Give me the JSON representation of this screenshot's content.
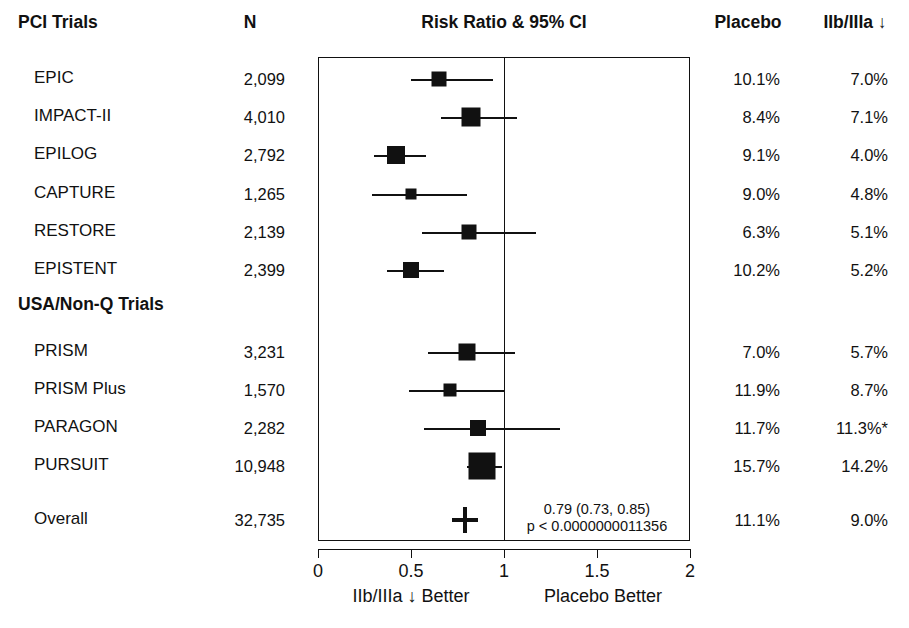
{
  "headers": {
    "trials": "PCI Trials",
    "n": "N",
    "plot_title": "Risk Ratio & 95% CI",
    "placebo": "Placebo",
    "treatment": "IIb/IIIa ↓"
  },
  "group_header_2": "USA/Non-Q Trials",
  "axis": {
    "ticks": [
      "0",
      "0.5",
      "1",
      "1.5",
      "2"
    ],
    "tick_values": [
      0,
      0.5,
      1,
      1.5,
      2
    ],
    "left_caption": "IIb/IIIa ↓ Better",
    "right_caption": "Placebo Better",
    "min": 0,
    "max": 2
  },
  "summary_annotation": {
    "estimate": "0.79 (0.73, 0.85)",
    "pvalue": "p < 0.0000000011356"
  },
  "chart_data": {
    "type": "forest",
    "title": "Risk Ratio & 95% CI",
    "xlabel": "Risk Ratio",
    "xlim": [
      0,
      2
    ],
    "null_value": 1,
    "grid": false,
    "legend": "none",
    "columns": [
      "Trial",
      "N",
      "Risk Ratio & 95% CI",
      "Placebo",
      "IIb/IIIa ↓"
    ],
    "groups": [
      {
        "name": "PCI Trials",
        "rows": [
          {
            "label": "EPIC",
            "n": "2,099",
            "rr": 0.65,
            "lo": 0.5,
            "hi": 0.94,
            "box": 15,
            "placebo": "10.1%",
            "treatment": "7.0%"
          },
          {
            "label": "IMPACT-II",
            "n": "4,010",
            "rr": 0.82,
            "lo": 0.66,
            "hi": 1.07,
            "box": 19,
            "placebo": "8.4%",
            "treatment": "7.1%"
          },
          {
            "label": "EPILOG",
            "n": "2,792",
            "rr": 0.42,
            "lo": 0.3,
            "hi": 0.58,
            "box": 18,
            "placebo": "9.1%",
            "treatment": "4.0%"
          },
          {
            "label": "CAPTURE",
            "n": "1,265",
            "rr": 0.5,
            "lo": 0.29,
            "hi": 0.8,
            "box": 11,
            "placebo": "9.0%",
            "treatment": "4.8%"
          },
          {
            "label": "RESTORE",
            "n": "2,139",
            "rr": 0.81,
            "lo": 0.56,
            "hi": 1.17,
            "box": 15,
            "placebo": "6.3%",
            "treatment": "5.1%"
          },
          {
            "label": "EPISTENT",
            "n": "2,399",
            "rr": 0.5,
            "lo": 0.37,
            "hi": 0.68,
            "box": 16,
            "placebo": "10.2%",
            "treatment": "5.2%"
          }
        ]
      },
      {
        "name": "USA/Non-Q Trials",
        "rows": [
          {
            "label": "PRISM",
            "n": "3,231",
            "rr": 0.8,
            "lo": 0.59,
            "hi": 1.06,
            "box": 17,
            "placebo": "7.0%",
            "treatment": "5.7%"
          },
          {
            "label": "PRISM Plus",
            "n": "1,570",
            "rr": 0.71,
            "lo": 0.49,
            "hi": 1.0,
            "box": 13,
            "placebo": "11.9%",
            "treatment": "8.7%"
          },
          {
            "label": "PARAGON",
            "n": "2,282",
            "rr": 0.86,
            "lo": 0.57,
            "hi": 1.3,
            "box": 16,
            "placebo": "11.7%",
            "treatment": "11.3%*"
          },
          {
            "label": "PURSUIT",
            "n": "10,948",
            "rr": 0.88,
            "lo": 0.8,
            "hi": 0.99,
            "box": 27,
            "placebo": "15.7%",
            "treatment": "14.2%"
          }
        ]
      }
    ],
    "overall": {
      "label": "Overall",
      "n": "32,735",
      "rr": 0.79,
      "lo": 0.73,
      "hi": 0.85,
      "placebo": "11.1%",
      "treatment": "9.0%"
    }
  }
}
